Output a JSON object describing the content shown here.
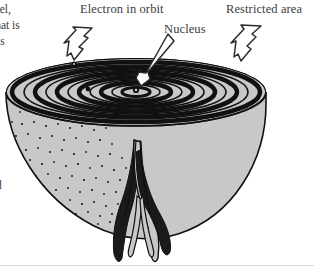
{
  "figure": {
    "kind": "scientific-diagram",
    "background_color": "#ffffff",
    "fill_color": "#c8c8c8",
    "line_color": "#111111",
    "text_color": "#3c3c3c"
  },
  "labels": {
    "electron": "Electron in orbit",
    "nucleus": "Nucleus",
    "restricted": "Restricted area"
  },
  "body_text_fragments": {
    "line1": "del,",
    "line2": "that is",
    "line3": "is",
    "line4": "d"
  },
  "pointers": [
    {
      "name": "electron-pointer",
      "style": "zigzag-arrow",
      "target": "electron-dot"
    },
    {
      "name": "nucleus-pointer",
      "style": "slim-arrow",
      "target": "nucleus-dot"
    },
    {
      "name": "restricted-pointer",
      "style": "zigzag-arrow",
      "target": "outer-rim"
    }
  ],
  "diagram_parts": {
    "orbits": "concentric-elliptical-orbits",
    "nucleus_dot": "nucleus-dot",
    "electron_dots": [
      "electron-dot-upper",
      "electron-dot-inner"
    ],
    "bowl": "cutaway-bowl",
    "stipple": "stippled-interior-texture",
    "tail": "root-tail"
  }
}
